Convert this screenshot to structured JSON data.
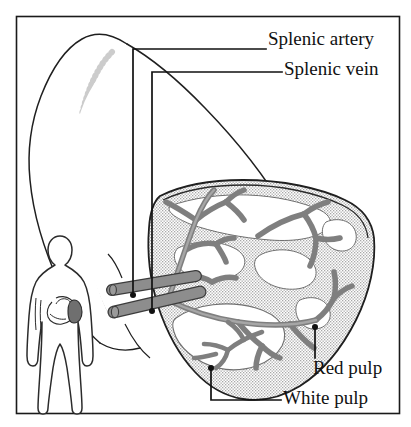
{
  "figure": {
    "frame": {
      "stroke_color": "#1a1a1a",
      "x": 16,
      "y": 16,
      "width": 384,
      "height": 398
    },
    "background_color": "#ffffff"
  },
  "colors": {
    "outline": "#1a1a1a",
    "vessel_fill": "#8d8d8d",
    "vessel_stroke": "#3a3a3a",
    "red_pulp_fill": "#d8d8d8",
    "white_pulp_fill": "#ffffff",
    "capsule": "#2a2a2a",
    "stipple": "#b5b5b5",
    "body_outline": "#2b2b2b",
    "body_spleen_fill": "#6f6f6f",
    "leader_line": "#111111"
  },
  "labels": [
    {
      "id": "splenic-artery",
      "text": "Splenic artery",
      "text_x": 268,
      "text_y": 41,
      "anchor_x": 133,
      "anchor_y": 295,
      "leader": "M133,295 L133,49 L266,49"
    },
    {
      "id": "splenic-vein",
      "text": "Splenic vein",
      "text_x": 284,
      "text_y": 71,
      "anchor_x": 152,
      "anchor_y": 311,
      "leader": "M152,311 L152,72 L282,72"
    },
    {
      "id": "red-pulp",
      "text": "Red pulp",
      "text_x": 313,
      "text_y": 370,
      "anchor_x": 315,
      "anchor_y": 327,
      "leader": "M315,327 L315,358"
    },
    {
      "id": "white-pulp",
      "text": "White pulp",
      "text_x": 283,
      "text_y": 400,
      "anchor_x": 211,
      "anchor_y": 368,
      "leader": "M211,368 L211,400 L281,400"
    }
  ],
  "structures": {
    "whole_organ": {
      "name": "whole-spleen-outline",
      "description": "Outlined intact spleen, upper left, faint inner stippling"
    },
    "sectioned_organ": {
      "name": "spleen-cross-section",
      "description": "Cut-away spleen showing red pulp stipple, white pulp islands, branching vessels"
    },
    "body_figure": {
      "name": "human-body-silhouette",
      "description": "Small human outline lower left with stomach and shaded spleen"
    },
    "vessels": {
      "name": "splenic-vessels",
      "description": "Two parallel gray trunks entering the hilum and arborizing"
    }
  },
  "anatomy_terms": {
    "red_pulp": "Red pulp",
    "white_pulp": "White pulp",
    "splenic_artery": "Splenic artery",
    "splenic_vein": "Splenic vein"
  }
}
